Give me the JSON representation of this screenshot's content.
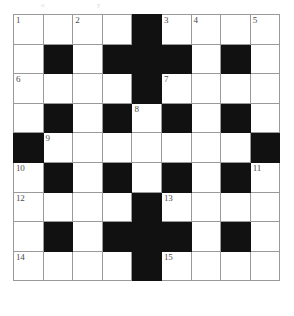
{
  "puzzle": {
    "type": "crossword-grid",
    "title": "Crossword Puzzle Grid",
    "rows": 9,
    "columns": 9,
    "symmetry": "180-degree rotational",
    "colors": {
      "block": "#111111",
      "cell": "#ffffff",
      "gridline": "#9a9a9a",
      "number": "#4a4a4a"
    },
    "legend": {
      "white": "open letter cell",
      "black": "blocked cell"
    },
    "grid": [
      [
        "white",
        "white",
        "white",
        "white",
        "black",
        "white",
        "white",
        "white",
        "white"
      ],
      [
        "white",
        "black",
        "white",
        "black",
        "black",
        "black",
        "white",
        "black",
        "white"
      ],
      [
        "white",
        "white",
        "white",
        "white",
        "black",
        "white",
        "white",
        "white",
        "white"
      ],
      [
        "white",
        "black",
        "white",
        "black",
        "white",
        "black",
        "white",
        "black",
        "white"
      ],
      [
        "black",
        "white",
        "white",
        "white",
        "white",
        "white",
        "white",
        "white",
        "black"
      ],
      [
        "white",
        "black",
        "white",
        "black",
        "white",
        "black",
        "white",
        "black",
        "white"
      ],
      [
        "white",
        "white",
        "white",
        "white",
        "black",
        "white",
        "white",
        "white",
        "white"
      ],
      [
        "white",
        "black",
        "white",
        "black",
        "black",
        "black",
        "white",
        "black",
        "white"
      ],
      [
        "white",
        "white",
        "white",
        "white",
        "black",
        "white",
        "white",
        "white",
        "white"
      ]
    ],
    "numbers": [
      [
        "1",
        "",
        "2",
        "",
        "",
        "3",
        "4",
        "",
        "5"
      ],
      [
        "",
        "",
        "",
        "",
        "",
        "",
        "",
        "",
        ""
      ],
      [
        "6",
        "",
        "",
        "",
        "",
        "7",
        "",
        "",
        ""
      ],
      [
        "",
        "",
        "",
        "",
        "8",
        "",
        "",
        "",
        ""
      ],
      [
        "",
        "9",
        "",
        "",
        "",
        "",
        "",
        "",
        ""
      ],
      [
        "10",
        "",
        "",
        "",
        "",
        "",
        "",
        "",
        "11"
      ],
      [
        "12",
        "",
        "",
        "",
        "",
        "13",
        "",
        "",
        ""
      ],
      [
        "",
        "",
        "",
        "",
        "",
        "",
        "",
        "",
        ""
      ],
      [
        "14",
        "",
        "",
        "",
        "",
        "15",
        "",
        "",
        ""
      ]
    ],
    "clue_numbers": [
      {
        "number": "1",
        "row": 0,
        "col": 0,
        "directions": [
          "across",
          "down"
        ]
      },
      {
        "number": "2",
        "row": 0,
        "col": 2,
        "directions": [
          "down"
        ]
      },
      {
        "number": "3",
        "row": 0,
        "col": 5,
        "directions": [
          "across",
          "down"
        ]
      },
      {
        "number": "4",
        "row": 0,
        "col": 6,
        "directions": [
          "down"
        ]
      },
      {
        "number": "5",
        "row": 0,
        "col": 8,
        "directions": [
          "down"
        ]
      },
      {
        "number": "6",
        "row": 2,
        "col": 0,
        "directions": [
          "across"
        ]
      },
      {
        "number": "7",
        "row": 2,
        "col": 5,
        "directions": [
          "across"
        ]
      },
      {
        "number": "8",
        "row": 3,
        "col": 4,
        "directions": [
          "down"
        ]
      },
      {
        "number": "9",
        "row": 4,
        "col": 1,
        "directions": [
          "across"
        ]
      },
      {
        "number": "10",
        "row": 5,
        "col": 0,
        "directions": [
          "down"
        ]
      },
      {
        "number": "11",
        "row": 5,
        "col": 8,
        "directions": [
          "down"
        ]
      },
      {
        "number": "12",
        "row": 6,
        "col": 0,
        "directions": [
          "across"
        ]
      },
      {
        "number": "13",
        "row": 6,
        "col": 5,
        "directions": [
          "across"
        ]
      },
      {
        "number": "14",
        "row": 8,
        "col": 0,
        "directions": [
          "across"
        ]
      },
      {
        "number": "15",
        "row": 8,
        "col": 5,
        "directions": [
          "across"
        ]
      }
    ]
  },
  "artifacts": [
    {
      "text": "o",
      "left": 41,
      "top": 1
    },
    {
      "text": "y",
      "left": 97,
      "top": 1
    }
  ]
}
